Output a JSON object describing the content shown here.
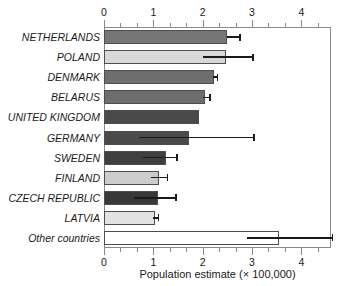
{
  "chart_data": {
    "type": "bar",
    "orientation": "horizontal",
    "title": "",
    "xlabel": "Population estimate (× 100,000)",
    "ylabel": "",
    "xlim": [
      0,
      4.6
    ],
    "xticks": [
      0,
      1,
      2,
      3,
      4
    ],
    "xticklabels": [
      "0",
      "1",
      "2",
      "3",
      "4"
    ],
    "minor_ticks_per_interval": 2,
    "grid": false,
    "legend": "none",
    "axis_positions": [
      "top",
      "bottom"
    ],
    "categories": [
      "NETHERLANDS",
      "POLAND",
      "DENMARK",
      "BELARUS",
      "UNITED KINGDOM",
      "GERMANY",
      "SWEDEN",
      "FINLAND",
      "CZECH REPUBLIC",
      "LATVIA",
      "Other countries"
    ],
    "values": [
      2.5,
      2.48,
      2.22,
      2.05,
      1.92,
      1.72,
      1.25,
      1.12,
      1.1,
      1.03,
      3.55
    ],
    "error_low": [
      2.5,
      2.0,
      2.2,
      2.0,
      null,
      0.7,
      0.8,
      0.95,
      0.6,
      1.0,
      2.9
    ],
    "error_high": [
      2.77,
      3.03,
      2.32,
      2.17,
      null,
      3.05,
      1.5,
      1.3,
      1.48,
      1.12,
      4.65
    ],
    "bar_colors": [
      "#767676",
      "#d8d8d8",
      "#6e6e6e",
      "#6e6e6e",
      "#4a4a4a",
      "#4a4a4a",
      "#3f3f3f",
      "#cccccc",
      "#383838",
      "#e2e2e2",
      "#ffffff"
    ],
    "bar_edge_color": "#4d4d4d",
    "error_color": "#1a1a1a",
    "frame_color": "#8a8a8a",
    "background": "#ffffff"
  }
}
